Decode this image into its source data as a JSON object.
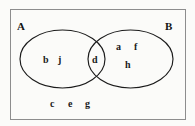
{
  "diagram": {
    "type": "venn-two-set",
    "universe": {
      "border_color": "#8d8d8d",
      "background_color": "#fbfbf9"
    },
    "sets": [
      {
        "id": "A",
        "label": "A",
        "stroke_color": "#1b1b1b"
      },
      {
        "id": "B",
        "label": "B",
        "stroke_color": "#1b1b1b"
      }
    ],
    "regions": {
      "a_only": {
        "name": "A only",
        "elements": [
          "b",
          "j"
        ]
      },
      "intersection": {
        "name": "A intersect B",
        "elements": [
          "d"
        ]
      },
      "b_only": {
        "name": "B only",
        "elements": [
          "a",
          "f",
          "h"
        ]
      },
      "outside": {
        "name": "Outside A and B",
        "elements": [
          "c",
          "e",
          "g"
        ]
      }
    },
    "elements": {
      "b": "b",
      "j": "j",
      "d": "d",
      "a": "a",
      "f": "f",
      "h": "h",
      "c": "c",
      "e": "e",
      "g": "g"
    }
  }
}
